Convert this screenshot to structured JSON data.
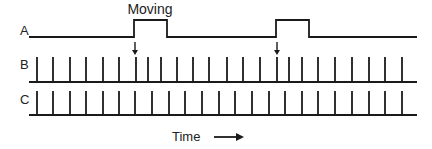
{
  "colors": {
    "ink": "#1a1a1a",
    "text": "#222222",
    "background": "#ffffff"
  },
  "rows": [
    {
      "id": "A",
      "label": "A",
      "label_x": 20,
      "label_y": 35
    },
    {
      "id": "B",
      "label": "B",
      "label_x": 20,
      "label_y": 69
    },
    {
      "id": "C",
      "label": "C",
      "label_x": 20,
      "label_y": 104
    }
  ],
  "trace_a": {
    "x_start": 29,
    "x_end": 417,
    "y_low": 37,
    "y_high": 20,
    "pulses": [
      {
        "x_on": 134,
        "x_off": 167
      },
      {
        "x_on": 276,
        "x_off": 309
      }
    ]
  },
  "event_label": {
    "text": "Moving",
    "x": 150,
    "y": 14
  },
  "event_arrows": [
    {
      "x": 135,
      "y_top": 42,
      "y_bottom": 55
    },
    {
      "x": 277,
      "y_top": 42,
      "y_bottom": 55
    }
  ],
  "trace_b": {
    "x_start": 29,
    "x_end": 417,
    "baseline_y": 82,
    "tick_top_y": 57,
    "spikes_x": [
      37,
      53,
      70,
      86,
      103,
      119,
      136,
      148,
      161,
      177,
      193,
      209,
      227,
      243,
      260,
      277,
      289,
      302,
      318,
      335,
      352,
      369,
      385,
      402
    ]
  },
  "trace_c": {
    "x_start": 29,
    "x_end": 417,
    "baseline_y": 115,
    "tick_top_y": 91,
    "spikes_x": [
      37,
      53,
      70,
      86,
      103,
      119,
      135,
      152,
      169,
      185,
      202,
      219,
      235,
      252,
      269,
      285,
      302,
      318,
      335,
      352,
      369,
      385,
      402
    ]
  },
  "time_axis": {
    "label": "Time",
    "label_x": 172,
    "label_y": 141,
    "arrow_x1": 214,
    "arrow_x2": 246,
    "arrow_y": 137
  }
}
